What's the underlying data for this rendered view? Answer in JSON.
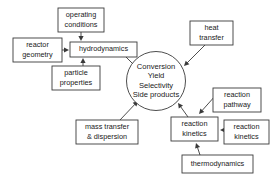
{
  "diagram": {
    "type": "influence-diagram",
    "canvas": {
      "width": 277,
      "height": 182,
      "background": "#ffffff"
    },
    "stroke_color": "#3a3a3a",
    "text_color": "#1a1a1a",
    "hub": {
      "id": "performance-hub",
      "shape": "circle",
      "cx": 156,
      "cy": 81,
      "r": 29.5,
      "lines": [
        "Conversion",
        "Yield",
        "Selectivity",
        "Side products"
      ]
    },
    "nodes": [
      {
        "id": "operating-conditions",
        "lines": [
          "operating",
          "conditions"
        ],
        "x": 58,
        "y": 8,
        "w": 46,
        "h": 24
      },
      {
        "id": "reactor-geometry",
        "lines": [
          "reactor",
          "geometry"
        ],
        "x": 13,
        "y": 38,
        "w": 49,
        "h": 24
      },
      {
        "id": "hydrodynamics",
        "lines": [
          "hydrodynamics"
        ],
        "x": 70,
        "y": 42,
        "w": 67,
        "h": 15
      },
      {
        "id": "particle-properties",
        "lines": [
          "particle",
          "properties"
        ],
        "x": 52,
        "y": 66,
        "w": 48,
        "h": 24
      },
      {
        "id": "heat-transfer",
        "lines": [
          "heat",
          "transfer"
        ],
        "x": 190,
        "y": 21,
        "w": 43,
        "h": 24
      },
      {
        "id": "mass-transfer-dispersion",
        "lines": [
          "mass transfer",
          "& dispersion"
        ],
        "x": 76,
        "y": 120,
        "w": 62,
        "h": 24
      },
      {
        "id": "reaction-pathway",
        "lines": [
          "reaction",
          "pathway"
        ],
        "x": 213,
        "y": 88,
        "w": 48,
        "h": 24
      },
      {
        "id": "reaction-kinetics-main",
        "lines": [
          "reaction",
          "kinetics"
        ],
        "x": 171,
        "y": 117,
        "w": 47,
        "h": 24
      },
      {
        "id": "reaction-kinetics-right",
        "lines": [
          "reaction",
          "kinetics"
        ],
        "x": 224,
        "y": 120,
        "w": 45,
        "h": 24
      },
      {
        "id": "thermodynamics",
        "lines": [
          "thermodynamics"
        ],
        "x": 182,
        "y": 155,
        "w": 71,
        "h": 18
      }
    ],
    "edges": [
      {
        "id": "edge-operating-to-hydrodynamics",
        "from": "operating-conditions",
        "to": "hydrodynamics",
        "path": "M 81 32 L 81 41"
      },
      {
        "id": "edge-geometry-to-hydrodynamics",
        "from": "reactor-geometry",
        "to": "hydrodynamics",
        "path": "M 62 50 L 69 50"
      },
      {
        "id": "edge-particle-to-hydrodynamics",
        "from": "particle-properties",
        "to": "hydrodynamics",
        "path": "M 83 66 L 83 58"
      },
      {
        "id": "edge-hydrodynamics-to-hub",
        "from": "hydrodynamics",
        "to": "performance-hub",
        "path": "M 126 57 L 137 68"
      },
      {
        "id": "edge-heat-to-hub",
        "from": "heat-transfer",
        "to": "performance-hub",
        "path": "M 205 45 L 184 66"
      },
      {
        "id": "edge-mass-to-hub",
        "from": "mass-transfer-dispersion",
        "to": "performance-hub",
        "path": "M 120 120 L 138 101"
      },
      {
        "id": "edge-kinetics-to-hub",
        "from": "reaction-kinetics-main",
        "to": "performance-hub",
        "path": "M 188 117 L 178 103"
      },
      {
        "id": "edge-pathway-to-kinetics",
        "from": "reaction-pathway",
        "to": "reaction-kinetics-main",
        "path": "M 216 95 L 199 114"
      },
      {
        "id": "edge-kinetics-right-to-kinetics",
        "from": "reaction-kinetics-right",
        "to": "reaction-kinetics-main",
        "path": "M 224 130 L 220 130"
      },
      {
        "id": "edge-thermodynamics-to-kinetics",
        "from": "thermodynamics",
        "to": "reaction-kinetics-main",
        "path": "M 200 155 L 196 143"
      }
    ]
  }
}
